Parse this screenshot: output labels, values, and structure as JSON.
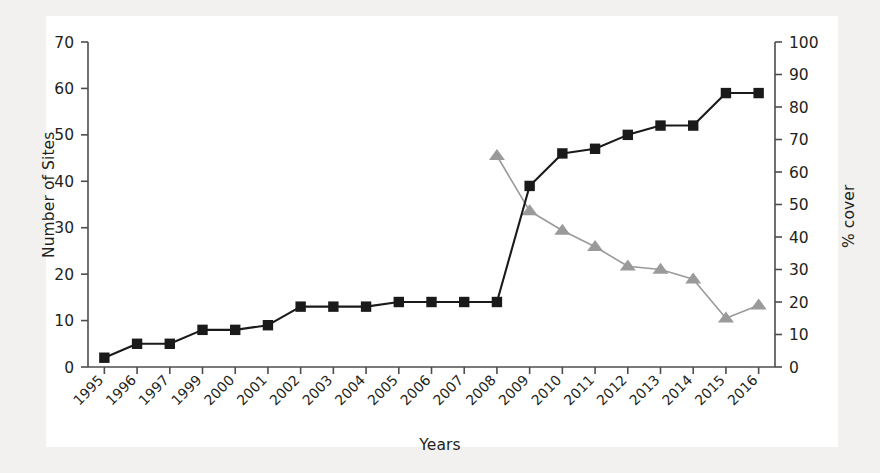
{
  "chart_data": {
    "type": "line",
    "title": "",
    "xlabel": "Years",
    "ylabel": "Number of Sites",
    "ylabel_right": "% cover",
    "categories": [
      "1995",
      "1996",
      "1997",
      "1999",
      "2000",
      "2001",
      "2002",
      "2003",
      "2004",
      "2005",
      "2006",
      "2007",
      "2008",
      "2009",
      "2010",
      "2011",
      "2012",
      "2013",
      "2014",
      "2015",
      "2016"
    ],
    "ylim": [
      0,
      70
    ],
    "ytick_labels": [
      "0",
      "10",
      "20",
      "30",
      "40",
      "50",
      "60",
      "70"
    ],
    "ytick_values": [
      0,
      10,
      20,
      30,
      40,
      50,
      60,
      70
    ],
    "ylim_right": [
      0,
      100
    ],
    "ytick_labels_right": [
      "0",
      "10",
      "20",
      "30",
      "40",
      "50",
      "60",
      "70",
      "80",
      "90",
      "100"
    ],
    "ytick_values_right": [
      0,
      10,
      20,
      30,
      40,
      50,
      60,
      70,
      80,
      90,
      100
    ],
    "grid": false,
    "legend": "none",
    "series": [
      {
        "name": "Number of Sites",
        "axis": "left",
        "marker": "square",
        "color": "#1a1a1a",
        "x": [
          "1995",
          "1996",
          "1997",
          "1999",
          "2000",
          "2001",
          "2002",
          "2003",
          "2004",
          "2005",
          "2006",
          "2007",
          "2008",
          "2009",
          "2010",
          "2011",
          "2012",
          "2013",
          "2014",
          "2015",
          "2016"
        ],
        "values": [
          2,
          5,
          5,
          8,
          8,
          9,
          13,
          13,
          13,
          14,
          14,
          14,
          14,
          39,
          46,
          47,
          50,
          52,
          52,
          59,
          59
        ]
      },
      {
        "name": "% cover",
        "axis": "right",
        "marker": "triangle",
        "color": "#9a9a9a",
        "x": [
          "2008",
          "2009",
          "2010",
          "2011",
          "2012",
          "2013",
          "2014",
          "2015",
          "2016"
        ],
        "values": [
          65,
          48,
          42,
          37,
          31,
          30,
          27,
          15,
          19
        ]
      }
    ]
  },
  "axes": {
    "left_title": "Number of Sites",
    "right_title": "% cover",
    "x_title": "Years"
  },
  "colors": {
    "sites_series": "#1a1a1a",
    "cover_series": "#9a9a9a",
    "axis": "#4d4d4d",
    "text": "#231f20",
    "background": "#ffffff"
  }
}
